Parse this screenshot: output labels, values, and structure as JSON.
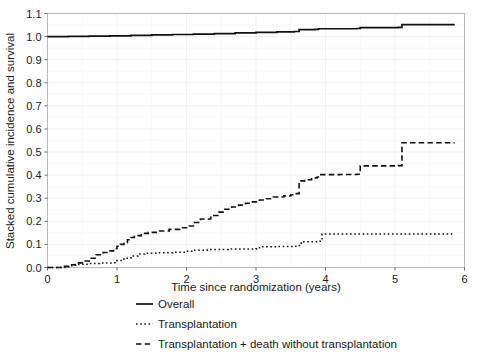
{
  "chart_data": {
    "type": "line",
    "title": "",
    "subtitle": "",
    "xlabel": "Time since randomization (years)",
    "ylabel": "Stacked cumulative incidence and survival",
    "xlim": [
      0,
      6
    ],
    "ylim": [
      0.0,
      1.1
    ],
    "xticks": [
      0,
      1,
      2,
      3,
      4,
      5,
      6
    ],
    "xtick_labels": [
      "0",
      "1",
      "2",
      "3",
      "4",
      "5",
      "6"
    ],
    "yticks": [
      0.0,
      0.1,
      0.2,
      0.3,
      0.4,
      0.5,
      0.6,
      0.7,
      0.8,
      0.9,
      1.0,
      1.1
    ],
    "ytick_labels": [
      "0.0",
      "0.1",
      "0.2",
      "0.3",
      "0.4",
      "0.5",
      "0.6",
      "0.7",
      "0.8",
      "0.9",
      "1.0",
      "1.1"
    ],
    "grid": true,
    "legend_position": "bottom",
    "step_type": "post",
    "series": [
      {
        "name": "Overall",
        "style": "solid",
        "color": "#111111",
        "x": [
          0.0,
          0.3,
          0.6,
          0.9,
          1.2,
          1.5,
          1.8,
          2.1,
          2.4,
          2.7,
          3.0,
          3.3,
          3.55,
          3.6,
          3.62,
          3.85,
          3.9,
          4.45,
          4.5,
          5.05,
          5.1,
          5.85
        ],
        "y": [
          1.0,
          1.001,
          1.002,
          1.003,
          1.005,
          1.007,
          1.009,
          1.011,
          1.013,
          1.016,
          1.018,
          1.02,
          1.022,
          1.022,
          1.03,
          1.031,
          1.034,
          1.035,
          1.039,
          1.04,
          1.052,
          1.053
        ]
      },
      {
        "name": "Transplantation",
        "style": "dotted",
        "color": "#111111",
        "x": [
          0.0,
          0.25,
          0.35,
          0.45,
          0.6,
          0.75,
          0.85,
          0.95,
          1.0,
          1.1,
          1.2,
          1.3,
          1.4,
          1.6,
          1.8,
          2.0,
          2.1,
          2.3,
          2.6,
          3.0,
          3.05,
          3.3,
          3.55,
          3.6,
          3.65,
          3.9,
          3.95,
          4.5,
          5.1,
          5.85
        ],
        "y": [
          0.0,
          0.003,
          0.01,
          0.014,
          0.017,
          0.019,
          0.02,
          0.021,
          0.03,
          0.04,
          0.05,
          0.058,
          0.062,
          0.064,
          0.066,
          0.07,
          0.075,
          0.078,
          0.08,
          0.081,
          0.09,
          0.091,
          0.092,
          0.095,
          0.112,
          0.114,
          0.145,
          0.145,
          0.145,
          0.145
        ]
      },
      {
        "name": "Transplantation + death without transplantation",
        "style": "dashed",
        "color": "#111111",
        "x": [
          0.0,
          0.22,
          0.3,
          0.4,
          0.5,
          0.6,
          0.7,
          0.8,
          0.9,
          0.95,
          1.0,
          1.05,
          1.1,
          1.15,
          1.2,
          1.25,
          1.35,
          1.45,
          1.6,
          1.75,
          1.9,
          2.0,
          2.1,
          2.2,
          2.35,
          2.45,
          2.55,
          2.65,
          2.75,
          2.85,
          2.95,
          3.05,
          3.15,
          3.25,
          3.4,
          3.5,
          3.58,
          3.62,
          3.7,
          3.8,
          3.88,
          3.92,
          4.2,
          4.45,
          4.5,
          5.05,
          5.1,
          5.85
        ],
        "y": [
          0.0,
          0.005,
          0.012,
          0.02,
          0.028,
          0.04,
          0.055,
          0.065,
          0.072,
          0.082,
          0.092,
          0.1,
          0.108,
          0.12,
          0.13,
          0.138,
          0.148,
          0.152,
          0.158,
          0.165,
          0.172,
          0.18,
          0.195,
          0.21,
          0.225,
          0.24,
          0.252,
          0.262,
          0.27,
          0.278,
          0.284,
          0.292,
          0.298,
          0.305,
          0.31,
          0.315,
          0.32,
          0.375,
          0.38,
          0.388,
          0.392,
          0.402,
          0.403,
          0.404,
          0.44,
          0.441,
          0.54,
          0.541
        ]
      }
    ]
  },
  "legend": {
    "entries": [
      {
        "label": "Overall",
        "style": "solid"
      },
      {
        "label": "Transplantation",
        "style": "dotted"
      },
      {
        "label": "Transplantation + death without transplantation",
        "style": "dashed"
      }
    ]
  }
}
